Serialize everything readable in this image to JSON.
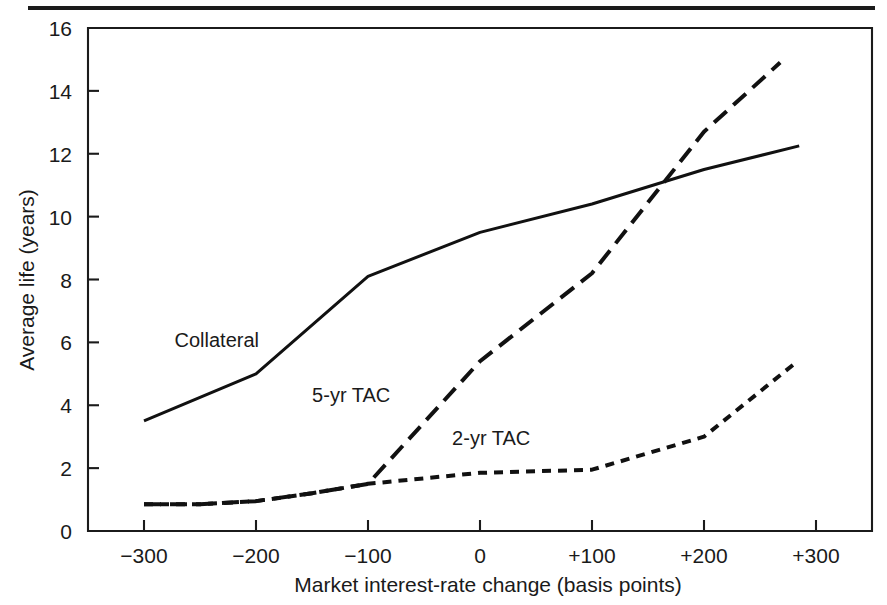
{
  "figure": {
    "top_rule": "horizontal-rule"
  },
  "chart_data": {
    "type": "line",
    "title": "",
    "xlabel": "Market interest-rate change (basis points)",
    "ylabel": "Average life (years)",
    "xlim": [
      -350,
      350
    ],
    "ylim": [
      0,
      16
    ],
    "xticks": [
      -300,
      -200,
      -100,
      0,
      100,
      200,
      300
    ],
    "xtick_labels": [
      "−300",
      "−200",
      "−100",
      "0",
      "+100",
      "+200",
      "+300"
    ],
    "yticks": [
      0,
      2,
      4,
      6,
      8,
      10,
      12,
      14,
      16
    ],
    "ytick_labels": [
      "0",
      "2",
      "4",
      "6",
      "8",
      "10",
      "12",
      "14",
      "16"
    ],
    "grid": false,
    "legend_position": "inline-annotations",
    "series": [
      {
        "name": "Collateral",
        "style": "solid",
        "label_x": -235,
        "label_y": 5.85,
        "x": [
          -300,
          -200,
          -100,
          0,
          100,
          200,
          285
        ],
        "y": [
          3.5,
          5.0,
          8.1,
          9.5,
          10.4,
          11.5,
          12.25
        ]
      },
      {
        "name": "5-yr TAC",
        "style": "long-dash",
        "label_x": -115,
        "label_y": 4.1,
        "x": [
          -300,
          -250,
          -200,
          -150,
          -100,
          0,
          100,
          200,
          268
        ],
        "y": [
          0.85,
          0.85,
          0.95,
          1.2,
          1.5,
          5.4,
          8.2,
          12.7,
          14.9
        ]
      },
      {
        "name": "2-yr TAC",
        "style": "short-dash",
        "label_x": 10,
        "label_y": 2.75,
        "x": [
          -300,
          -250,
          -200,
          -150,
          -100,
          0,
          100,
          200,
          280
        ],
        "y": [
          0.85,
          0.85,
          0.95,
          1.2,
          1.5,
          1.85,
          1.95,
          3.0,
          5.3
        ]
      }
    ]
  }
}
